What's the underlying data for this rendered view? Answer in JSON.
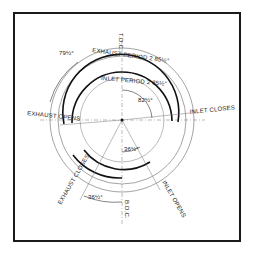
{
  "diagram": {
    "labels": {
      "tdc": "T.D.C.",
      "bdc": "B.D.C.",
      "exhaust_period": "EXHAUST PERIOD 2 85½°",
      "inlet_period": "INLET PERIOD 2 85½°",
      "exhaust_opens": "EXHAUST OPENS",
      "exhaust_closes": "EXHAUST CLOSES",
      "inlet_opens": "INLET OPENS",
      "inlet_closes": "INLET CLOSES",
      "angle_79": "79½°",
      "angle_82": "82½°",
      "angle_36_inner": "36½°",
      "angle_36_outer": "36½°"
    }
  }
}
